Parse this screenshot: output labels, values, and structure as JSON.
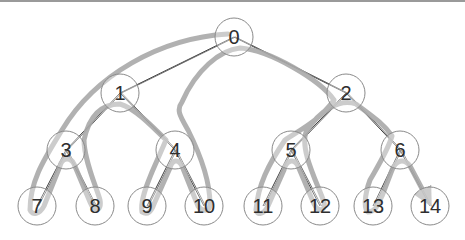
{
  "diagram": {
    "type": "binary-tree-traversal",
    "nodes": [
      {
        "id": "0",
        "label": "0",
        "x": 234,
        "y": 37
      },
      {
        "id": "1",
        "label": "1",
        "x": 120,
        "y": 93
      },
      {
        "id": "2",
        "label": "2",
        "x": 346,
        "y": 93
      },
      {
        "id": "3",
        "label": "3",
        "x": 66,
        "y": 150
      },
      {
        "id": "4",
        "label": "4",
        "x": 175,
        "y": 150
      },
      {
        "id": "5",
        "label": "5",
        "x": 291,
        "y": 150
      },
      {
        "id": "6",
        "label": "6",
        "x": 400,
        "y": 150
      },
      {
        "id": "7",
        "label": "7",
        "x": 37,
        "y": 206
      },
      {
        "id": "8",
        "label": "8",
        "x": 95,
        "y": 206
      },
      {
        "id": "9",
        "label": "9",
        "x": 147,
        "y": 206
      },
      {
        "id": "10",
        "label": "10",
        "x": 204,
        "y": 206
      },
      {
        "id": "11",
        "label": "11",
        "x": 263,
        "y": 206
      },
      {
        "id": "12",
        "label": "12",
        "x": 320,
        "y": 206
      },
      {
        "id": "13",
        "label": "13",
        "x": 373,
        "y": 206
      },
      {
        "id": "14",
        "label": "14",
        "x": 430,
        "y": 206
      }
    ],
    "edges": [
      [
        "0",
        "1"
      ],
      [
        "0",
        "2"
      ],
      [
        "1",
        "3"
      ],
      [
        "1",
        "4"
      ],
      [
        "2",
        "5"
      ],
      [
        "2",
        "6"
      ],
      [
        "3",
        "7"
      ],
      [
        "3",
        "8"
      ],
      [
        "4",
        "9"
      ],
      [
        "4",
        "10"
      ],
      [
        "5",
        "11"
      ],
      [
        "5",
        "12"
      ],
      [
        "6",
        "13"
      ],
      [
        "6",
        "14"
      ]
    ],
    "traversal_path_end": "14",
    "colors": {
      "node_stroke": "#8a8a8a",
      "edge": "#3c3c3c",
      "traversal": "#a9a9a9",
      "label": "#2e2e2e",
      "top_border": "#9a9a9a"
    }
  }
}
